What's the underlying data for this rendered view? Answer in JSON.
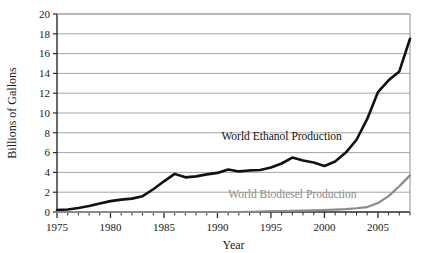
{
  "chart_data": {
    "type": "line",
    "title": "",
    "xlabel": "Year",
    "ylabel": "Billions of Gallons",
    "xlim": [
      1975,
      2008
    ],
    "ylim": [
      0,
      20
    ],
    "ytick_step": 2,
    "xtick_step": 5,
    "xminor_tick_step": 1,
    "grid": "horizontal",
    "legend_position": "inline-annotation",
    "background_color": "#ffffff",
    "gridline_color": "#9a9a9a",
    "axis_color": "#2b2b2b",
    "ytick_labels": [
      "0",
      "2",
      "4",
      "6",
      "8",
      "10",
      "12",
      "14",
      "16",
      "18",
      "20"
    ],
    "ytick_values": [
      0,
      2,
      4,
      6,
      8,
      10,
      12,
      14,
      16,
      18,
      20
    ],
    "xtick_labels": [
      "1975",
      "1980",
      "1985",
      "1990",
      "1995",
      "2000",
      "2005"
    ],
    "xtick_values": [
      1975,
      1980,
      1985,
      1990,
      1995,
      2000,
      2005
    ],
    "x": [
      1975,
      1976,
      1977,
      1978,
      1979,
      1980,
      1981,
      1982,
      1983,
      1984,
      1985,
      1986,
      1987,
      1988,
      1989,
      1990,
      1991,
      1992,
      1993,
      1994,
      1995,
      1996,
      1997,
      1998,
      1999,
      2000,
      2001,
      2002,
      2003,
      2004,
      2005,
      2006,
      2007,
      2008
    ],
    "series": [
      {
        "name": "World Ethanol Production",
        "color": "#111111",
        "line_width": 2.6,
        "label_x": 1996.0,
        "label_y": 7.3,
        "values": [
          0.2,
          0.25,
          0.4,
          0.6,
          0.85,
          1.1,
          1.25,
          1.35,
          1.6,
          2.3,
          3.1,
          3.85,
          3.5,
          3.6,
          3.8,
          3.95,
          4.3,
          4.1,
          4.2,
          4.25,
          4.5,
          4.9,
          5.5,
          5.2,
          5.0,
          4.65,
          5.1,
          6.0,
          7.3,
          9.4,
          12.1,
          13.3,
          14.2,
          17.5
        ]
      },
      {
        "name": "World Biodiesel Production",
        "color": "#8a8a8a",
        "line_width": 2.2,
        "label_x": 1997.0,
        "label_y": 1.45,
        "values": [
          0.0,
          0.0,
          0.0,
          0.0,
          0.0,
          0.0,
          0.0,
          0.0,
          0.0,
          0.0,
          0.0,
          0.0,
          0.0,
          0.0,
          0.0,
          0.0,
          0.0,
          0.0,
          0.02,
          0.05,
          0.08,
          0.1,
          0.12,
          0.14,
          0.16,
          0.2,
          0.25,
          0.3,
          0.38,
          0.5,
          0.9,
          1.6,
          2.6,
          3.7
        ]
      }
    ]
  },
  "plot_geometry": {
    "left": 57,
    "right": 410,
    "top": 14,
    "bottom": 212
  }
}
